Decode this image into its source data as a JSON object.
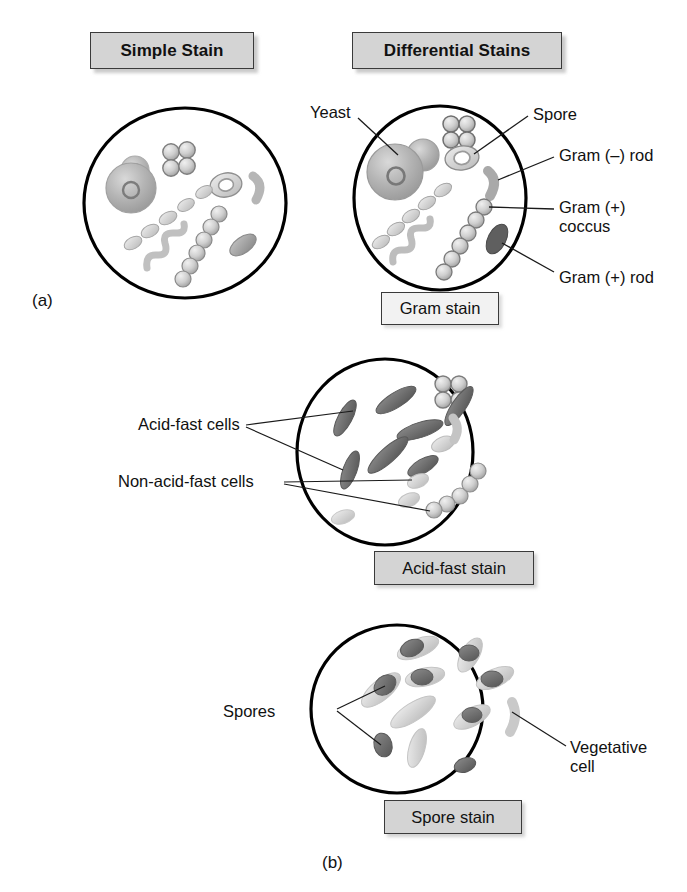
{
  "figure": {
    "panel_a_letter": "(a)",
    "panel_b_letter": "(b)"
  },
  "headers": {
    "simple": "Simple Stain",
    "differential": "Differential Stains"
  },
  "captions": {
    "gram": "Gram stain",
    "acid_fast": "Acid-fast stain",
    "spore": "Spore stain"
  },
  "annotations": {
    "yeast": "Yeast",
    "spore": "Spore",
    "gram_negative_rod": "Gram (–) rod",
    "gram_positive_coccus": "Gram (+)\ncoccus",
    "gram_positive_rod": "Gram (+) rod",
    "acid_fast_cells": "Acid-fast cells",
    "non_acid_fast_cells": "Non-acid-fast cells",
    "spores": "Spores",
    "vegetative_cell": "Vegetative\ncell"
  },
  "colors": {
    "header_box_fill": "#d4d4d4",
    "caption_box_fill": "#d4d4d4",
    "gram_caption_fill": "#f2f2f2",
    "box_border": "#3a3a3a",
    "circle_outline": "#000000",
    "cell_light": "#cfcfcf",
    "cell_mid": "#9e9e9e",
    "cell_dark": "#6e6e6e",
    "cell_very_dark": "#4f4f4f",
    "leader_line": "#1a1a1a",
    "text": "#111111"
  },
  "panels": [
    {
      "id": "simple-stain",
      "title": "Simple Stain",
      "caption": null,
      "description": "All cells stained a uniform single color: yeast cell with bud, tetrad of cocci, rods, spirillum, chain of cocci, spore-containing rod.",
      "cell_types": [
        "yeast",
        "tetrad cocci",
        "rods",
        "spirillum",
        "coccus chain",
        "endospore rod"
      ]
    },
    {
      "id": "gram-stain",
      "title": "Gram stain",
      "labels": [
        "Yeast",
        "Spore",
        "Gram (–) rod",
        "Gram (+) coccus",
        "Gram (+) rod"
      ],
      "description": "Differential stain distinguishing Gram positive (dark) from Gram negative (light) cells."
    },
    {
      "id": "acid-fast-stain",
      "title": "Acid-fast stain",
      "labels": [
        "Acid-fast cells",
        "Non-acid-fast cells"
      ],
      "description": "Acid-fast rods appear dark; non-acid-fast cocci and rods appear light."
    },
    {
      "id": "spore-stain",
      "title": "Spore stain",
      "labels": [
        "Spores",
        "Vegetative cell"
      ],
      "description": "Endospores appear dark within light vegetative cells; free spores also dark."
    }
  ]
}
